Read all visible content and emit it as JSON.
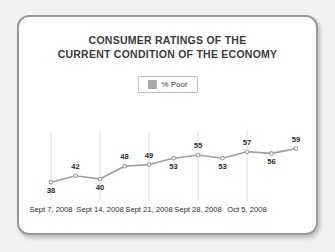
{
  "card": {
    "title_line1": "CONSUMER RATINGS OF THE",
    "title_line2": "CURRENT CONDITION OF THE ECONOMY"
  },
  "legend": {
    "series_label": "% Poor",
    "swatch_color": "#a8a8a8"
  },
  "colors": {
    "line": "#9e9e9e",
    "marker": "#9e9e9e",
    "gridline": "#dcdcdc",
    "title_text": "#3b3b3b",
    "label_text": "#2b2b2b",
    "card_border": "#9a9a9a",
    "card_background": "#ffffff",
    "page_background": "#f2f2f2"
  },
  "chart_data": {
    "type": "line",
    "title": "CONSUMER RATINGS OF THE CURRENT CONDITION OF THE ECONOMY",
    "xlabel": "",
    "ylabel": "",
    "grid": true,
    "legend_position": "top-center",
    "ylim": [
      30,
      65
    ],
    "series": [
      {
        "name": "% Poor",
        "values": [
          38,
          42,
          40,
          48,
          49,
          53,
          55,
          53,
          57,
          56,
          59
        ],
        "label_positions": [
          "below",
          "above",
          "below",
          "above",
          "above",
          "below",
          "above",
          "below",
          "above",
          "below",
          "above"
        ]
      }
    ],
    "x_indices": [
      0,
      1,
      2,
      3,
      4,
      5,
      6,
      7,
      8,
      9,
      10
    ],
    "tick_labels": [
      "Sept 7, 2008",
      "Sept 14, 2008",
      "Sept 21, 2008",
      "Sept 28, 2008",
      "Oct 5, 2008"
    ],
    "tick_indices": [
      0,
      2,
      4,
      6,
      8
    ],
    "gridline_indices": [
      0,
      2,
      4,
      6,
      8
    ]
  }
}
